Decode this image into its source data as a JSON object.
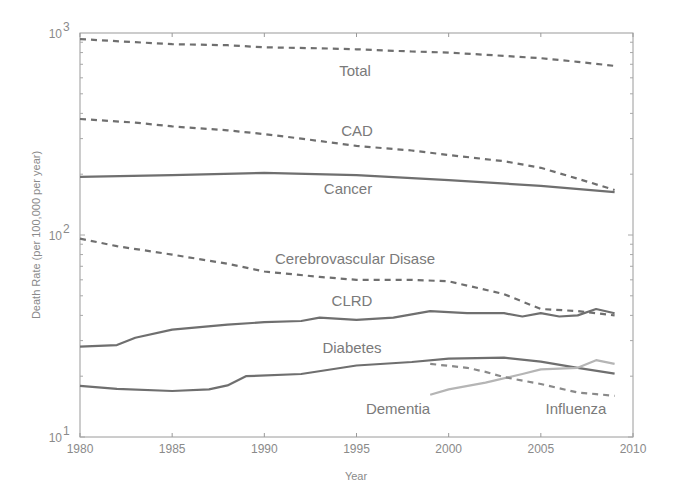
{
  "chart_data": {
    "type": "line",
    "title": "",
    "xlabel": "Year",
    "ylabel": "Death Rate (per 100,000 per year)",
    "yscale": "log",
    "xlim": [
      1980,
      2010
    ],
    "ylim": [
      10,
      1000
    ],
    "grid": false,
    "legend": "inline labels",
    "x_ticks": [
      "1980",
      "1985",
      "1990",
      "1995",
      "2000",
      "2005",
      "2010"
    ],
    "y_ticks": [
      {
        "value": 10,
        "base": "10",
        "exp": "1"
      },
      {
        "value": 100,
        "base": "10",
        "exp": "2"
      },
      {
        "value": 1000,
        "base": "10",
        "exp": "3"
      }
    ],
    "series": [
      {
        "name": "Total",
        "style": "dashed",
        "color": "#6f6f6f",
        "label_pos": [
          355,
          76
        ],
        "x": [
          1980,
          1983,
          1985,
          1988,
          1990,
          1993,
          1995,
          1998,
          2000,
          2003,
          2005,
          2007,
          2009
        ],
        "values": [
          933,
          900,
          880,
          870,
          850,
          840,
          830,
          810,
          800,
          770,
          750,
          720,
          687
        ]
      },
      {
        "name": "CAD",
        "style": "dashed",
        "color": "#6f6f6f",
        "label_pos": [
          357,
          136
        ],
        "x": [
          1980,
          1983,
          1985,
          1988,
          1990,
          1992,
          1995,
          1998,
          2000,
          2003,
          2005,
          2007,
          2009
        ],
        "values": [
          375,
          360,
          345,
          330,
          316,
          300,
          276,
          262,
          249,
          232,
          215,
          190,
          167
        ]
      },
      {
        "name": "Cancer",
        "style": "solid",
        "color": "#6f6f6f",
        "label_pos": [
          348,
          194
        ],
        "x": [
          1980,
          1985,
          1990,
          1995,
          2000,
          2005,
          2009
        ],
        "values": [
          194,
          198,
          203,
          198,
          187,
          175,
          163
        ]
      },
      {
        "name": "Cerebrovascular Disase",
        "style": "dashed",
        "color": "#6f6f6f",
        "label_pos": [
          355,
          264
        ],
        "x": [
          1980,
          1982,
          1985,
          1988,
          1990,
          1993,
          1995,
          1998,
          2000,
          2003,
          2005,
          2007,
          2009
        ],
        "values": [
          96,
          88,
          80,
          72,
          66,
          62,
          60,
          60,
          59,
          51,
          43,
          42,
          40
        ]
      },
      {
        "name": "CLRD",
        "style": "solid",
        "color": "#6f6f6f",
        "label_pos": [
          352,
          306
        ],
        "x": [
          1980,
          1982,
          1983,
          1985,
          1988,
          1990,
          1992,
          1993,
          1995,
          1997,
          1999,
          2001,
          2003,
          2004,
          2005,
          2006,
          2007,
          2008,
          2009
        ],
        "values": [
          28,
          28.5,
          31,
          34,
          36,
          37,
          37.5,
          39,
          38,
          39,
          42,
          41,
          41,
          39.5,
          41,
          39.5,
          40,
          43,
          41
        ]
      },
      {
        "name": "Diabetes",
        "style": "solid",
        "color": "#6f6f6f",
        "label_pos": [
          352,
          353
        ],
        "x": [
          1980,
          1982,
          1985,
          1987,
          1988,
          1989,
          1992,
          1995,
          1998,
          2000,
          2003,
          2005,
          2007,
          2009
        ],
        "values": [
          17.9,
          17.3,
          16.9,
          17.2,
          18,
          20,
          20.5,
          22.6,
          23.5,
          24.4,
          24.7,
          23.6,
          22,
          20.6
        ]
      },
      {
        "name": "Dementia",
        "style": "solid",
        "color": "#b5b5b5",
        "label_pos": [
          398,
          414
        ],
        "x": [
          1999,
          2000,
          2002,
          2004,
          2005,
          2007,
          2008,
          2009
        ],
        "values": [
          16.2,
          17.2,
          18.6,
          20.5,
          21.6,
          22,
          24,
          23
        ]
      },
      {
        "name": "Influenza",
        "style": "dashed",
        "color": "#8a8a8a",
        "label_pos": [
          576,
          414
        ],
        "x": [
          1999,
          2001,
          2002,
          2003,
          2005,
          2007,
          2008,
          2009
        ],
        "values": [
          23,
          22,
          21,
          19.8,
          18.3,
          16.6,
          16.3,
          16
        ]
      }
    ]
  }
}
